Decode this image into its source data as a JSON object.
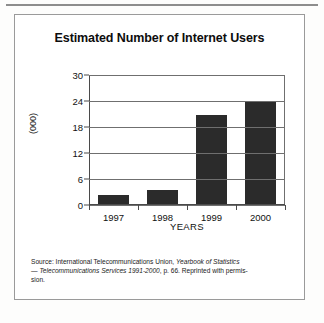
{
  "figure": {
    "title": "Estimated Number of Internet Users"
  },
  "chart_data": {
    "type": "bar",
    "title": "Estimated Number of Internet Users",
    "xlabel": "YEARS",
    "ylabel": "(000)",
    "categories": [
      "1997",
      "1998",
      "1999",
      "2000"
    ],
    "values": [
      2.0,
      3.2,
      20.5,
      23.8
    ],
    "ylim": [
      0,
      30
    ],
    "yticks": [
      0,
      6,
      12,
      18,
      24,
      30
    ],
    "ytick_labels": [
      "0",
      "6",
      "12",
      "18",
      "24",
      "30"
    ],
    "grid": true,
    "legend": "none",
    "bar_color": "#2b2b2b"
  },
  "source": {
    "line1_prefix": "Source: International Telecommunications Union, ",
    "line1_italic": "Yearbook of Statistics",
    "line2_prefix": "— ",
    "line2_italic": "Telecommunications Services 1991-2000",
    "line2_suffix": ", p. 66. Reprinted with permis-",
    "line3": "sion."
  }
}
